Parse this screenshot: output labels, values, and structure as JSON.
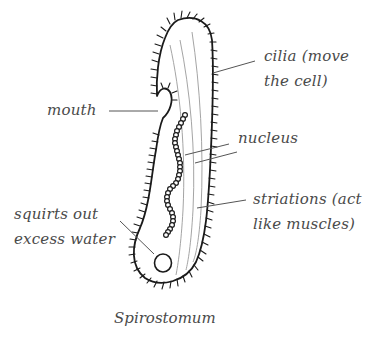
{
  "diagram": {
    "title": "Spirostomum",
    "labels": {
      "cilia": {
        "line1": "cilia  (move",
        "line2": "the cell)"
      },
      "mouth": {
        "line1": "mouth"
      },
      "nucleus": {
        "line1": "nucleus"
      },
      "striations": {
        "line1": "striations (act",
        "line2": "like muscles)"
      },
      "vacuole": {
        "line1": "squirts out",
        "line2": "excess water"
      }
    },
    "colors": {
      "outline": "#1a1a1a",
      "striation": "#9a9a9a",
      "leader": "#555555",
      "text": "#4a4a4a",
      "background": "#ffffff"
    }
  }
}
